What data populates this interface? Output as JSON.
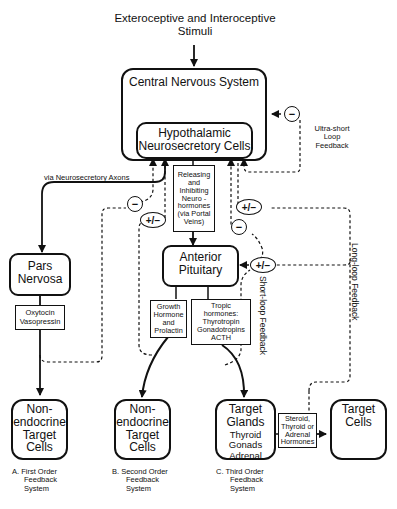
{
  "title": {
    "line1": "Exteroceptive and Interoceptive",
    "line2": "Stimuli"
  },
  "nodes": {
    "cns": "Central Nervous System",
    "hypothalamic_1": "Hypothalamic",
    "hypothalamic_2": "Neurosecretory Cells",
    "releasing": [
      "Releasing",
      "and",
      "Inhibiting",
      "Neuro -",
      "hormones",
      "(via Portal",
      "Veins)"
    ],
    "pars_nervosa_1": "Pars",
    "pars_nervosa_2": "Nervosa",
    "oxytocin": [
      "Oxytocin",
      "Vasopressin"
    ],
    "anterior_pituitary_1": "Anterior",
    "anterior_pituitary_2": "Pituitary",
    "growth": [
      "Growth",
      "Hormone",
      "and",
      "Prolactin"
    ],
    "tropic": [
      "Tropic",
      "hormones:",
      "Thyrotropin",
      "Gonadotropins",
      "ACTH"
    ],
    "nonendo_a": [
      "Non-",
      "endocrine",
      "Target",
      "Cells"
    ],
    "nonendo_b": [
      "Non-",
      "endocrine",
      "Target",
      "Cells"
    ],
    "target_glands": [
      "Target",
      "Glands"
    ],
    "target_glands_sub": [
      "Thyroid",
      "Gonads",
      "Adrenal"
    ],
    "steroid": [
      "Steroid,",
      "Thyroid or",
      "Adrenal",
      "Hormones"
    ],
    "target_cells": [
      "Target",
      "Cells"
    ]
  },
  "labels": {
    "via_axons": "via Neurosecretory Axons",
    "ultra_short": [
      "Ultra-short",
      "Loop",
      "Feedback"
    ],
    "short_loop": "Short-loop Feedback",
    "long_loop": "Long-loop Feedback"
  },
  "signs": {
    "minus": "−",
    "plus_minus": "+/−"
  },
  "captions": {
    "a": [
      "A.  First Order",
      "Feedback",
      "System"
    ],
    "b": [
      "B.  Second Order",
      "Feedback",
      "System"
    ],
    "c": [
      "C.  Third Order",
      "Feedback",
      "System"
    ]
  }
}
